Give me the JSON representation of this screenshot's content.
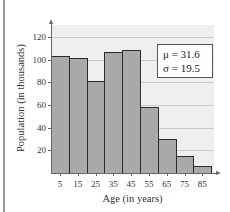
{
  "chart_data": {
    "type": "bar",
    "title": "",
    "xlabel": "Age (in years)",
    "ylabel": "Population (in thousands)",
    "categories": [
      "5",
      "15",
      "25",
      "35",
      "45",
      "55",
      "65",
      "75",
      "85"
    ],
    "values": [
      103,
      101,
      81,
      107,
      108,
      58,
      30,
      15,
      6
    ],
    "ylim": [
      0,
      130
    ],
    "yticks": [
      20,
      40,
      60,
      80,
      100,
      120
    ],
    "grid": true,
    "bar_color": "#a9a9a9",
    "bar_edge_color": "#2b2b2b",
    "background_color": "#efefef",
    "annotations": [
      {
        "text": "μ = 31.6",
        "symbol": "μ",
        "value": "31.6"
      },
      {
        "text": "σ = 19.5",
        "symbol": "σ",
        "value": "19.5"
      }
    ]
  },
  "labels": {
    "x_title": "Age (in years)",
    "y_title": "Population (in thousands)",
    "yticks": [
      "20",
      "40",
      "60",
      "80",
      "100",
      "120"
    ],
    "xticks": [
      "5",
      "15",
      "25",
      "35",
      "45",
      "55",
      "65",
      "75",
      "85"
    ],
    "mean": "μ = 31.6",
    "std": "σ = 19.5"
  }
}
